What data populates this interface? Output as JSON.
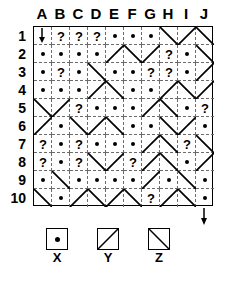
{
  "grid": {
    "columns": [
      "A",
      "B",
      "C",
      "D",
      "E",
      "F",
      "G",
      "H",
      "I",
      "J"
    ],
    "rows": [
      "1",
      "2",
      "3",
      "4",
      "5",
      "6",
      "7",
      "8",
      "9",
      "10"
    ],
    "cell_size": 18,
    "symbols": {
      "dot": "X",
      "forward_diagonal": "Y",
      "back_diagonal": "Z",
      "unknown": "?"
    },
    "cells": [
      [
        "arrow",
        "?",
        "?",
        "?",
        "dot",
        "dot",
        "dot",
        "back",
        "fwd",
        "back"
      ],
      [
        "dot",
        "dot",
        "dot",
        "dot",
        "fwd",
        "back",
        "fwd",
        "?",
        "dot",
        "back"
      ],
      [
        "dot",
        "?",
        "dot",
        "back",
        "dot",
        "dot",
        "?",
        "?",
        "dot",
        "fwd"
      ],
      [
        "dot",
        "dot",
        "dot",
        "fwd",
        "back",
        "dot",
        "dot",
        "fwd",
        "back",
        "fwd"
      ],
      [
        "back",
        "fwd",
        "?",
        "dot",
        "dot",
        "dot",
        "fwd",
        "back",
        "dot",
        "?"
      ],
      [
        "fwd",
        "dot",
        "back",
        "fwd",
        "back",
        "dot",
        "dot",
        "back",
        "fwd",
        "dot"
      ],
      [
        "?",
        "dot",
        "?",
        "dot",
        "dot",
        "dot",
        "fwd",
        "back",
        "?",
        "back"
      ],
      [
        "?",
        "dot",
        "?",
        "back",
        "fwd",
        "?",
        "fwd",
        "back",
        "dot",
        "fwd"
      ],
      [
        "dot",
        "back",
        "dot",
        "dot",
        "dot",
        "dot",
        "fwd",
        "dot",
        "back",
        "dot"
      ],
      [
        "back",
        "dot",
        "fwd",
        "back",
        "fwd",
        "back",
        "?",
        "fwd",
        "back",
        "dot"
      ]
    ]
  },
  "arrows": {
    "start": {
      "label": "entry-arrow",
      "direction": "down",
      "cell": "A1"
    },
    "end": {
      "label": "exit-arrow",
      "direction": "down",
      "cell": "J10"
    }
  },
  "legend": {
    "items": [
      {
        "key": "X",
        "type": "dot",
        "label": "X"
      },
      {
        "key": "Y",
        "type": "fwd",
        "label": "Y"
      },
      {
        "key": "Z",
        "type": "back",
        "label": "Z"
      }
    ]
  }
}
